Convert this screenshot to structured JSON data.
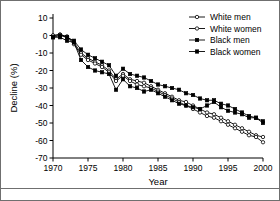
{
  "chart_data": {
    "type": "line",
    "title": "",
    "xlabel": "Year",
    "ylabel": "Decline (%)",
    "xlim": [
      1970,
      2000
    ],
    "ylim": [
      -70,
      10
    ],
    "xticks": [
      1970,
      1975,
      1980,
      1985,
      1990,
      1995,
      2000
    ],
    "yticks": [
      10,
      0,
      -10,
      -20,
      -30,
      -40,
      -50,
      -60,
      -70
    ],
    "grid": false,
    "legend_position": "top-right",
    "x": [
      1970,
      1971,
      1972,
      1973,
      1974,
      1975,
      1976,
      1977,
      1978,
      1979,
      1980,
      1981,
      1982,
      1983,
      1984,
      1985,
      1986,
      1987,
      1988,
      1989,
      1990,
      1991,
      1992,
      1993,
      1994,
      1995,
      1996,
      1997,
      1998,
      1999,
      2000
    ],
    "series": [
      {
        "name": "White men",
        "marker": "open-circle",
        "values": [
          0,
          0.5,
          -0.5,
          -4,
          -10,
          -13,
          -15,
          -17,
          -20,
          -25,
          -22,
          -25,
          -26,
          -27,
          -29,
          -31,
          -33,
          -35,
          -37,
          -38,
          -40,
          -42,
          -44,
          -45,
          -47,
          -49,
          -51,
          -53,
          -55,
          -57,
          -58
        ]
      },
      {
        "name": "White women",
        "marker": "open-circle",
        "values": [
          0,
          0.5,
          -1,
          -5,
          -11,
          -14,
          -16,
          -18,
          -21,
          -26,
          -23,
          -26,
          -28,
          -29,
          -30,
          -32,
          -34,
          -36,
          -38,
          -40,
          -42,
          -44,
          -46,
          -47,
          -49,
          -51,
          -53,
          -55,
          -57,
          -58,
          -61
        ]
      },
      {
        "name": "Black men",
        "marker": "filled-square",
        "values": [
          -1,
          0,
          -1,
          -3,
          -8,
          -11,
          -13,
          -15,
          -17,
          -23,
          -19,
          -22,
          -23,
          -24,
          -26,
          -28,
          -29,
          -30,
          -31,
          -33,
          -34,
          -36,
          -37,
          -37,
          -39,
          -40,
          -42,
          -44,
          -46,
          -47,
          -50
        ]
      },
      {
        "name": "Black women",
        "marker": "filled-square",
        "values": [
          -1,
          -1,
          -3,
          -4,
          -14,
          -18,
          -20,
          -21,
          -22,
          -31,
          -25,
          -29,
          -30,
          -32,
          -31,
          -33,
          -35,
          -37,
          -39,
          -40,
          -41,
          -42,
          -40,
          -38,
          -41,
          -43,
          -44,
          -45,
          -47,
          -47,
          -49
        ]
      }
    ],
    "legend": [
      {
        "label": "White men",
        "marker": "open-circle"
      },
      {
        "label": "White women",
        "marker": "open-circle"
      },
      {
        "label": "Black men",
        "marker": "filled-square"
      },
      {
        "label": "Black women",
        "marker": "filled-square"
      }
    ]
  }
}
